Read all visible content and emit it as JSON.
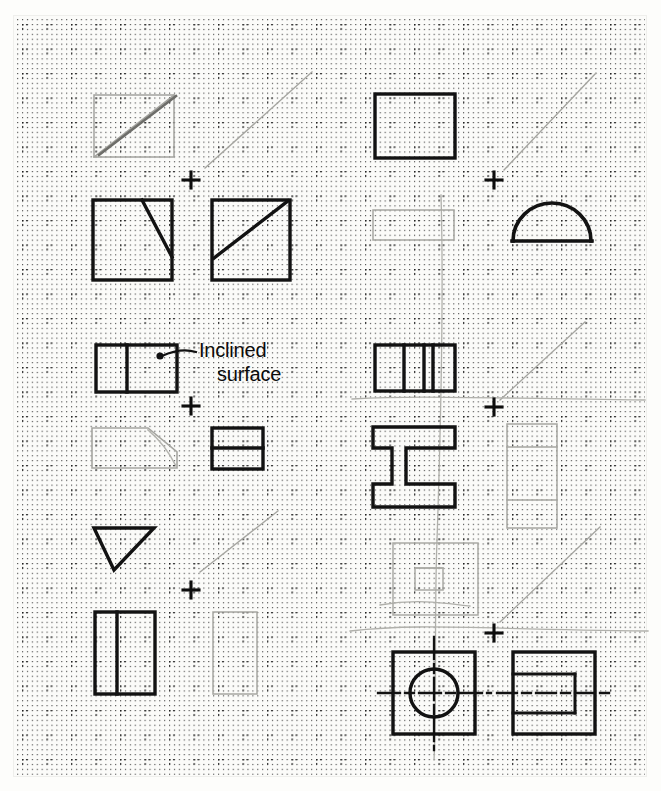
{
  "sheet": {
    "title": "Orthographic projection practice sheet",
    "media": "dot-grid graph paper",
    "width_px": 661,
    "height_px": 791,
    "paper_color": "#fbfbf9",
    "ink_color": "#111111",
    "construction_color": "#9a9a96",
    "grid": {
      "dot_color": "#3a3a3a",
      "minor_spacing_px": 4.9,
      "major_spacing_px": 24.5,
      "origin_x": 22,
      "origin_y": 24,
      "style": "dotted rows and columns with bolder cross dots at major intersections"
    }
  },
  "annotations": [
    {
      "name": "inclined-surface-callout",
      "line1": "Inclined",
      "line2": "surface",
      "x": 196,
      "y": 340,
      "leader": {
        "dot_x": 160,
        "dot_y": 356,
        "bend_x": 192,
        "bend_y": 352
      }
    }
  ],
  "registration_marks": [
    {
      "name": "crosshair-left-1",
      "x": 191,
      "y": 180
    },
    {
      "name": "crosshair-left-2",
      "x": 191,
      "y": 406
    },
    {
      "name": "crosshair-left-3",
      "x": 191,
      "y": 590
    },
    {
      "name": "crosshair-right-1",
      "x": 494,
      "y": 180
    },
    {
      "name": "crosshair-right-2",
      "x": 494,
      "y": 407
    },
    {
      "name": "crosshair-right-3",
      "x": 494,
      "y": 633
    }
  ],
  "figures": [
    {
      "name": "figure-top-left-faint-square",
      "kind": "construction",
      "description": "faint square with diagonal, top-left, partly erased",
      "weight": "light"
    },
    {
      "name": "figure-front-view-notched-square",
      "kind": "view",
      "description": "bold square with diagonal from top-right area down to bottom-right corner",
      "weight": "bold"
    },
    {
      "name": "figure-side-view-diagonal-square",
      "kind": "view",
      "description": "bold square with diagonal from bottom-left to top-right",
      "weight": "bold"
    },
    {
      "name": "figure-inclined-top-view",
      "kind": "view",
      "description": "bold rectangle divided by one vertical line, target of Inclined surface callout",
      "weight": "bold"
    },
    {
      "name": "figure-inclined-front-faint",
      "kind": "construction",
      "description": "faint trapezoid, sloped upper right edge",
      "weight": "light"
    },
    {
      "name": "figure-inclined-side-view",
      "kind": "view",
      "description": "small bold rectangle split by a horizontal line",
      "weight": "bold"
    },
    {
      "name": "figure-inverted-triangle",
      "kind": "view",
      "description": "bold downward pointing triangle",
      "weight": "bold"
    },
    {
      "name": "figure-divided-rectangle",
      "kind": "view",
      "description": "bold tall rectangle with one vertical divider near the left",
      "weight": "bold"
    },
    {
      "name": "figure-faint-tall-rectangle",
      "kind": "construction",
      "description": "faint tall rectangle to the right of the divided rectangle",
      "weight": "light"
    },
    {
      "name": "figure-plain-rectangle-top-right",
      "kind": "view",
      "description": "bold plain rectangle, right column top",
      "weight": "bold"
    },
    {
      "name": "figure-faint-rectangle-right",
      "kind": "construction",
      "description": "faint flat rectangle below the plain rectangle",
      "weight": "light"
    },
    {
      "name": "figure-dome-semicircle",
      "kind": "view",
      "description": "bold semicircular dome sitting on a baseline",
      "weight": "bold"
    },
    {
      "name": "figure-ibeam-top-view",
      "kind": "view",
      "description": "bold rectangle with three internal vertical dividers",
      "weight": "bold"
    },
    {
      "name": "figure-ibeam-front-view",
      "kind": "view",
      "description": "bold I-beam profile outline",
      "weight": "bold"
    },
    {
      "name": "figure-faint-stacked-rectangle",
      "kind": "construction",
      "description": "faint rectangle with two horizontal dividers, right of the I-beam",
      "weight": "light"
    },
    {
      "name": "figure-faint-square-with-inner-rect",
      "kind": "construction",
      "description": "faint square containing a faint inner rectangle",
      "weight": "light"
    },
    {
      "name": "figure-square-with-circle",
      "kind": "view",
      "description": "bold square containing a circle with vertical and horizontal centerlines",
      "weight": "bold"
    },
    {
      "name": "figure-square-with-hidden-rect",
      "kind": "view",
      "description": "bold square with an internal hidden-line rectangle and centerline",
      "weight": "bold"
    }
  ],
  "projection_rays": [
    {
      "name": "ray-left-1",
      "x1": 205,
      "y1": 168,
      "x2": 312,
      "y2": 72
    },
    {
      "name": "ray-left-2",
      "x1": 200,
      "y1": 572,
      "x2": 278,
      "y2": 511
    },
    {
      "name": "ray-right-1",
      "x1": 504,
      "y1": 170,
      "x2": 596,
      "y2": 73
    },
    {
      "name": "ray-right-2",
      "x1": 500,
      "y1": 400,
      "x2": 585,
      "y2": 322
    },
    {
      "name": "ray-right-3",
      "x1": 500,
      "y1": 622,
      "x2": 600,
      "y2": 527
    }
  ]
}
